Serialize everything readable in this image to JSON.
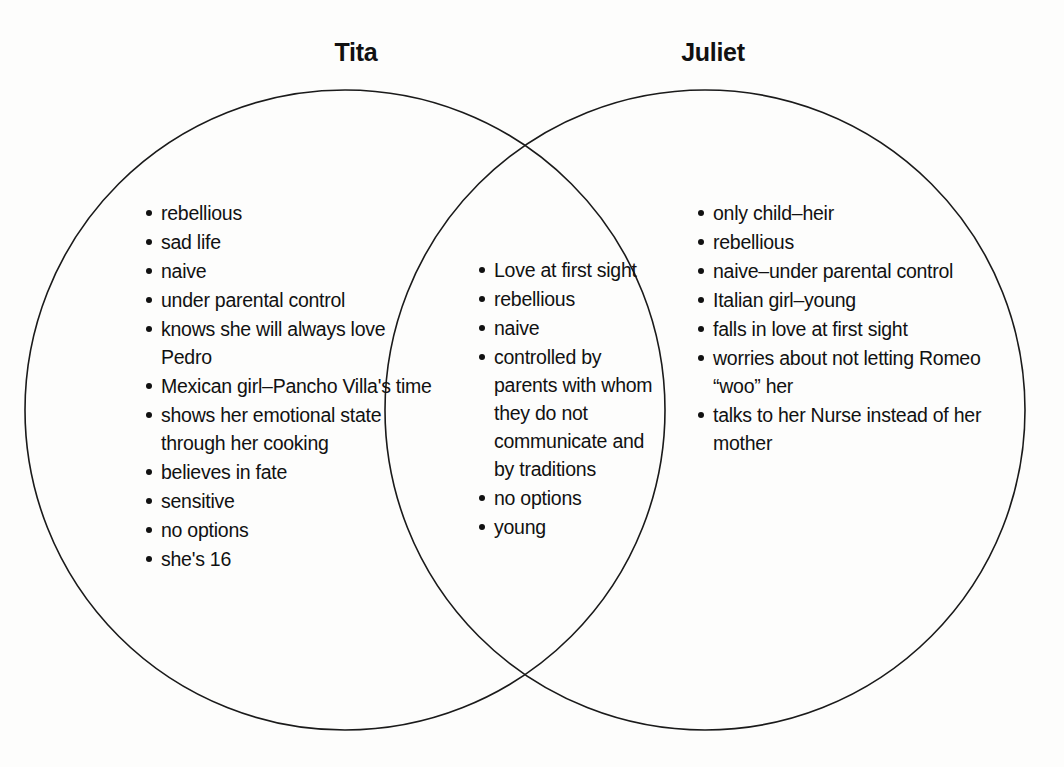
{
  "diagram": {
    "type": "venn",
    "title_left": "Tita",
    "title_right": "Juliet",
    "stroke_color": "#1a1a1a",
    "background_color": "#fdfdfc",
    "text_color": "#111111"
  },
  "left_circle": {
    "label": "Tita",
    "items": [
      "rebellious",
      "sad life",
      "naive",
      "under parental control",
      "knows she will always love Pedro",
      "Mexican girl–Pancho Villa's time",
      "shows her emotional state through her cooking",
      "believes in fate",
      "sensitive",
      "no options",
      "she's 16"
    ]
  },
  "overlap": {
    "items": [
      "Love at first sight",
      "rebellious",
      "naive",
      "controlled by parents with whom they do not communicate and by traditions",
      "no options",
      "young"
    ]
  },
  "right_circle": {
    "label": "Juliet",
    "items": [
      "only child–heir",
      "rebellious",
      "naive–under parental control",
      "Italian girl–young",
      "falls in love at first sight",
      "worries about not letting Romeo “woo” her",
      "talks to her Nurse instead of her mother"
    ]
  }
}
